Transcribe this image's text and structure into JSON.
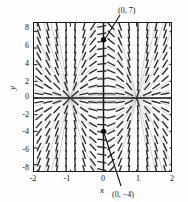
{
  "figure": {
    "type": "slope-field",
    "axis_titles": {
      "x": "x",
      "y": "y"
    }
  },
  "axes": {
    "x_ticks": [
      "-2",
      "-1",
      "0",
      "1",
      "2"
    ],
    "x_tick_values": [
      -2,
      -1,
      0,
      1,
      2
    ],
    "y_ticks": [
      "8",
      "6",
      "4",
      "2",
      "0",
      "-2",
      "-4",
      "-6",
      "-8"
    ],
    "y_tick_values": [
      8,
      6,
      4,
      2,
      0,
      -2,
      -4,
      -6,
      -8
    ],
    "xlim": [
      -2.1,
      2.1
    ],
    "ylim": [
      -9.0,
      9.0
    ]
  },
  "annotations": [
    {
      "text": "(0, 7)",
      "point_x": 0,
      "point_y": 7
    },
    {
      "text": "(0, −4)",
      "point_x": 0,
      "point_y": -4
    }
  ],
  "colors": {
    "frame": "#1a1a1a",
    "axis": "#111111",
    "dash": "#2b2b2b",
    "curve": "#b9b9b9",
    "marker": "#0d0d0d",
    "background": "#fdfdfd"
  },
  "chart_data": {
    "type": "line",
    "title": "",
    "xlabel": "x",
    "ylabel": "y",
    "xlim": [
      -2.1,
      2.1
    ],
    "ylim": [
      -9.0,
      9.0
    ],
    "grid": false,
    "legend": null,
    "marked_points": [
      {
        "label": "(0, 7)",
        "x": 0,
        "y": 7
      },
      {
        "label": "(0, −4)",
        "x": 0,
        "y": -4
      }
    ],
    "slope_field": {
      "description": "short dashes showing dy/dx = 2xy/(x^2-1) at grid nodes",
      "x_samples": [
        -1.95,
        -1.68,
        -1.41,
        -1.13,
        -0.86,
        -0.59,
        -0.32,
        -0.05,
        0.23,
        0.5,
        0.77,
        1.04,
        1.32,
        1.59,
        1.86
      ],
      "y_samples": [
        8.6,
        7.7,
        6.8,
        5.9,
        5.0,
        4.1,
        3.2,
        2.3,
        1.4,
        0.5,
        -0.5,
        -1.4,
        -2.3,
        -3.2,
        -4.1,
        -5.0,
        -5.9,
        -6.8,
        -7.7,
        -8.6
      ]
    },
    "solution_curves": {
      "description": "light gray integral curves y = C(x^2 - 1), saddle at y=0, asymptotic near x=+-1",
      "constants": [
        -9,
        -6,
        -4,
        -2.5,
        -1.4,
        -0.7,
        -0.3,
        0.3,
        0.7,
        1.4,
        2.5,
        4,
        6,
        9
      ]
    }
  }
}
